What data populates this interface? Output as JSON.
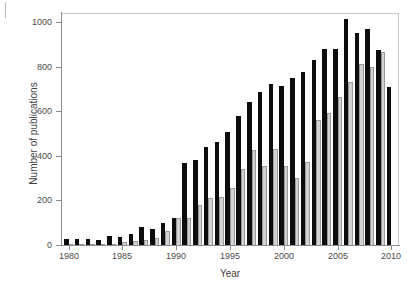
{
  "chart_data": {
    "type": "bar",
    "title": "",
    "xlabel": "Year",
    "ylabel": "Number of publications",
    "xlim": [
      1979.3,
      2010.7
    ],
    "ylim": [
      0,
      1040
    ],
    "yticks": [
      0,
      200,
      400,
      600,
      800,
      1000
    ],
    "xticks": [
      1980,
      1985,
      1990,
      1995,
      2000,
      2005,
      2010
    ],
    "grid": false,
    "legend": "none",
    "categories": [
      1980,
      1981,
      1982,
      1983,
      1984,
      1985,
      1986,
      1987,
      1988,
      1989,
      1990,
      1991,
      1992,
      1993,
      1994,
      1995,
      1996,
      1997,
      1998,
      1999,
      2000,
      2001,
      2002,
      2003,
      2004,
      2005,
      2006,
      2007,
      2008,
      2009,
      2010
    ],
    "series": [
      {
        "name": "series-black",
        "color": "#0d0d0d",
        "values": [
          25,
          28,
          27,
          24,
          42,
          38,
          50,
          80,
          74,
          97,
          120,
          366,
          382,
          440,
          460,
          508,
          580,
          640,
          684,
          720,
          714,
          748,
          776,
          830,
          880,
          880,
          1015,
          952,
          968,
          876,
          710
        ]
      },
      {
        "name": "series-gray",
        "color": "#d2d2d2",
        "values": [
          3,
          4,
          4,
          5,
          6,
          12,
          18,
          24,
          30,
          64,
          120,
          122,
          178,
          210,
          214,
          256,
          342,
          424,
          356,
          430,
          352,
          300,
          372,
          562,
          590,
          664,
          732,
          810,
          800,
          866,
          0
        ]
      }
    ],
    "ytick_labels": [
      "0",
      "200",
      "400",
      "600",
      "800",
      "1000"
    ],
    "xtick_labels": [
      "1980",
      "1985",
      "1990",
      "1995",
      "2000",
      "2005",
      "2010"
    ]
  },
  "axes": {
    "x_title": "Year",
    "y_title": "Number of publications"
  }
}
